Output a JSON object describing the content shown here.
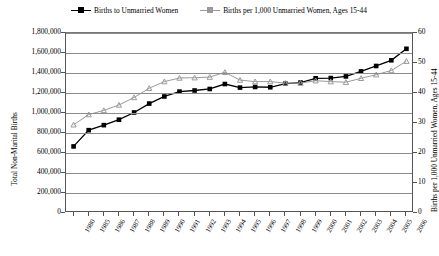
{
  "legend": {
    "items": [
      {
        "label": "Births to Unmarried Women",
        "color": "#000000",
        "marker": "square"
      },
      {
        "label": "Births per 1,000 Unmarried Women, Ages 15-44",
        "color": "#9a9a9a",
        "marker": "triangle"
      }
    ]
  },
  "axes": {
    "y_left_title": "Total Non-Marital Births",
    "y_right_title": "Births per 1,000 Unmarried Women, Ages 15-44",
    "y_left_ticks": [
      "0",
      "200,000",
      "400,000",
      "600,000",
      "800,000",
      "1,000,000",
      "1,200,000",
      "1,400,000",
      "1,600,000",
      "1,800,000"
    ],
    "y_right_ticks": [
      "0",
      "10",
      "20",
      "30",
      "40",
      "50",
      "60"
    ]
  },
  "chart_data": {
    "type": "line",
    "title": "",
    "xlabel": "",
    "ylabel": "Total Non-Marital Births",
    "y2label": "Births per 1,000 Unmarried Women, Ages 15-44",
    "grid": true,
    "legend_position": "top",
    "categories": [
      "1980",
      "1985",
      "1986",
      "1987",
      "1988",
      "1989",
      "1990",
      "1991",
      "1992",
      "1993",
      "1994",
      "1995",
      "1996",
      "1997",
      "1998",
      "1999",
      "2000",
      "2001",
      "2002",
      "2003",
      "2004",
      "2005",
      "2006"
    ],
    "ylim": [
      0,
      1800000
    ],
    "y2lim": [
      0,
      60
    ],
    "series": [
      {
        "name": "Births to Unmarried Women",
        "axis": "left",
        "color": "#000000",
        "values": [
          665747,
          828174,
          878477,
          933013,
          1005299,
          1094169,
          1165384,
          1213769,
          1224876,
          1240172,
          1289592,
          1253976,
          1260306,
          1257444,
          1293567,
          1304594,
          1347043,
          1349249,
          1365966,
          1415995,
          1470189,
          1527034,
          1641946
        ]
      },
      {
        "name": "Births per 1,000 Unmarried Women, Ages 15-44",
        "axis": "right",
        "color": "#9a9a9a",
        "values": [
          29.4,
          32.8,
          34.2,
          36.0,
          38.5,
          41.6,
          43.8,
          45.0,
          45.1,
          45.3,
          46.9,
          44.3,
          43.8,
          43.8,
          43.3,
          43.3,
          44.1,
          43.8,
          43.6,
          44.9,
          46.1,
          47.5,
          50.6
        ]
      }
    ]
  }
}
